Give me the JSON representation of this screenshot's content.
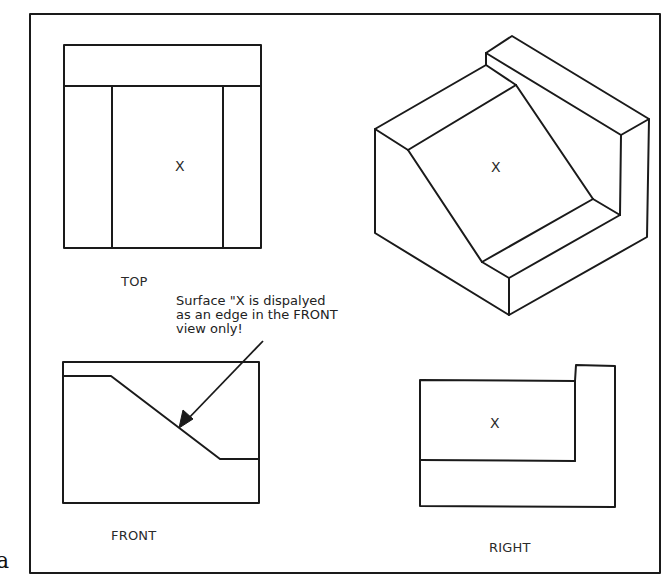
{
  "figure": {
    "letter": "a",
    "border_color": "#1a1a1a",
    "views": {
      "top": {
        "label": "TOP",
        "surface_mark": "X"
      },
      "front": {
        "label": "FRONT"
      },
      "right": {
        "label": "RIGHT",
        "surface_mark": "X"
      },
      "isometric": {
        "surface_mark": "X"
      }
    },
    "annotation": {
      "lines": [
        "Surface \"X is dispalyed",
        "as an edge in the FRONT",
        "view only!"
      ]
    }
  }
}
